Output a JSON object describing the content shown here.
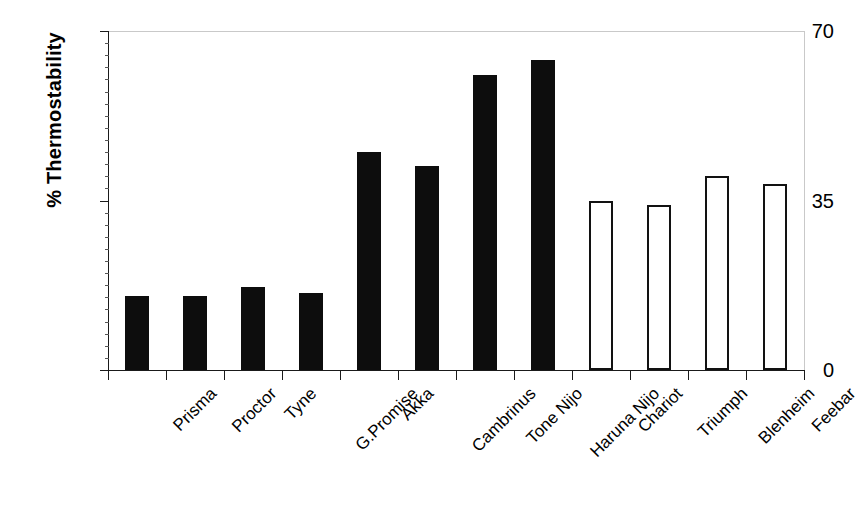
{
  "chart_data": {
    "type": "bar",
    "title": "",
    "xlabel": "",
    "ylabel": "% Thermostability",
    "ylim": [
      0,
      70
    ],
    "yticks": [
      0,
      35,
      70
    ],
    "ytick_labels": [
      "0",
      "35",
      "70"
    ],
    "grid": false,
    "legend": null,
    "categories": [
      "Prisma",
      "Proctor",
      "Tyne",
      "G.Promise",
      "Akka",
      "Cambrinus",
      "Tone Nijo",
      "Haruna Nijo",
      "Chariot",
      "Triumph",
      "Blenheim",
      "Feebar"
    ],
    "values": [
      15.3,
      15.3,
      17.1,
      16.0,
      45.1,
      42.1,
      61.0,
      64.0,
      35.0,
      34.0,
      40.0,
      38.5
    ],
    "bar_styles": [
      "filled",
      "filled",
      "filled",
      "filled",
      "filled",
      "filled",
      "filled",
      "filled",
      "open",
      "open",
      "open",
      "open"
    ],
    "colors": {
      "filled": "#0d0d0d",
      "open_fill": "#ffffff",
      "open_stroke": "#121212",
      "axis": "#1a1a1a",
      "frame": "#c9c9c9",
      "background": "#ffffff",
      "text": "#000000"
    }
  }
}
